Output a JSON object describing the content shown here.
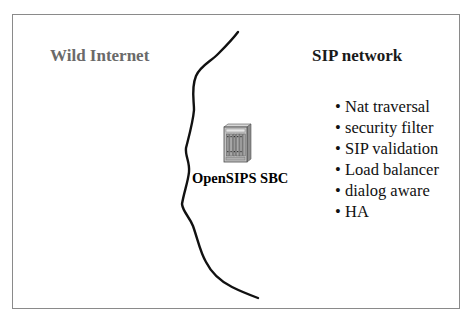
{
  "diagram": {
    "regions": {
      "left_label": "Wild Internet",
      "right_label": "SIP network"
    },
    "device": {
      "icon": "server-chassis-icon",
      "label": "OpenSIPS SBC"
    },
    "features": {
      "bullet": "•",
      "items": [
        "Nat traversal",
        "security filter",
        "SIP validation",
        "Load balancer",
        "dialog aware",
        "HA"
      ]
    },
    "colors": {
      "frame": "#8a8a8a",
      "left_label": "#6a6a6a",
      "right_label": "#1a1a1a",
      "boundary_line": "#111111",
      "server_body": "#b8b8b8"
    }
  }
}
